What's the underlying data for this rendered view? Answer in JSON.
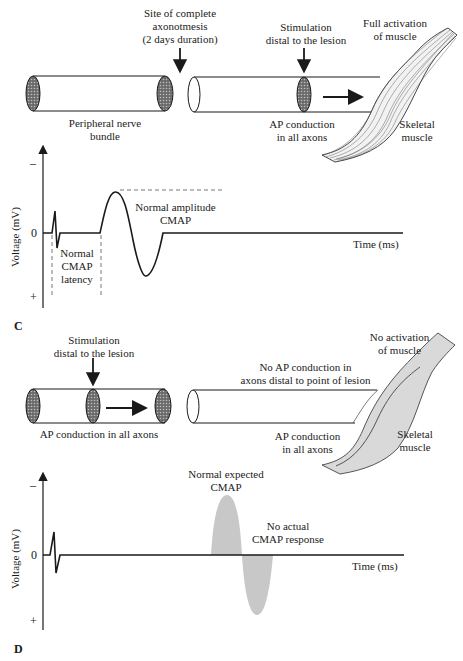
{
  "panel_c": {
    "letter": "C",
    "labels": {
      "lesion_site": [
        "Site of complete",
        "axonotmesis",
        "(2 days duration)"
      ],
      "stimulation": [
        "Stimulation",
        "distal to the lesion"
      ],
      "activation": [
        "Full activation",
        "of muscle"
      ],
      "nerve_bundle": [
        "Peripheral nerve",
        "bundle"
      ],
      "ap_conduction": [
        "AP conduction",
        "in all axons"
      ],
      "muscle": [
        "Skeletal",
        "muscle"
      ]
    },
    "graph": {
      "ylabel": "Voltage (mV)",
      "xlabel": "Time (ms)",
      "tick_minus": "–",
      "tick_zero": "0",
      "tick_plus": "+",
      "latency_label": [
        "Normal",
        "CMAP",
        "latency"
      ],
      "amplitude_label": [
        "Normal amplitude",
        "CMAP"
      ]
    }
  },
  "panel_d": {
    "letter": "D",
    "labels": {
      "stimulation": [
        "Stimulation",
        "distal to the lesion"
      ],
      "ap_conduction_bundle": "AP conduction in all axons",
      "no_ap": [
        "No AP conduction in",
        "axons distal to point of lesion"
      ],
      "ap_conduction": [
        "AP conduction",
        "in all axons"
      ],
      "activation": [
        "No activation",
        "of muscle"
      ],
      "muscle": [
        "Skeletal",
        "muscle"
      ]
    },
    "graph": {
      "ylabel": "Voltage (mV)",
      "xlabel": "Time (ms)",
      "tick_minus": "–",
      "tick_zero": "0",
      "tick_plus": "+",
      "expected_label": [
        "Normal expected",
        "CMAP"
      ],
      "actual_label": [
        "No actual",
        "CMAP response"
      ]
    }
  },
  "colors": {
    "line": "#1a1a1a",
    "hatch": "#555555",
    "ghost_cmap": "#c8c8c8",
    "muscle_fill_d": "#d9d9d9"
  }
}
